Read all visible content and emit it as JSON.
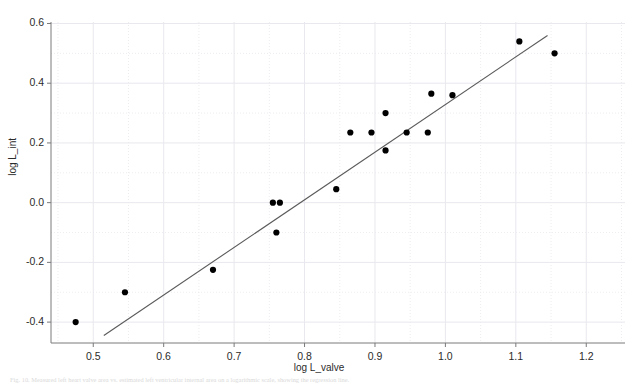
{
  "figure": {
    "background_color": "#ffffff",
    "frame_color": "#7a7a7a",
    "grid_color": "#e8e8ee",
    "point_color": "#000000",
    "line_color": "#5a5a5a",
    "caption": "Fig. 10.  Measured left heart valve area vs. estimated left ventricular internal area on a logarithmic scale, showing the regression line."
  },
  "chart_data": {
    "type": "scatter",
    "title": "",
    "xlabel": "log L_valve",
    "ylabel": "log L_int",
    "xlim": [
      0.44,
      1.255
    ],
    "ylim": [
      -0.47,
      0.605
    ],
    "grid": true,
    "legend": null,
    "xticks": [
      "0.5",
      "0.6",
      "0.7",
      "0.8",
      "0.9",
      "1.0",
      "1.1",
      "1.2"
    ],
    "xtick_values": [
      0.5,
      0.6,
      0.7,
      0.8,
      0.9,
      1.0,
      1.1,
      1.2
    ],
    "yticks": [
      "0.6",
      "0.4",
      "0.2",
      "0.0",
      "-0.2",
      "-0.4"
    ],
    "ytick_values": [
      0.6,
      0.4,
      0.2,
      0.0,
      -0.2,
      -0.4
    ],
    "minor_grid_x": [
      0.45,
      0.55,
      0.65,
      0.75,
      0.85,
      0.95,
      1.05,
      1.15,
      1.25
    ],
    "minor_grid_y": [
      0.5,
      0.3,
      0.1,
      -0.1,
      -0.3
    ],
    "points": [
      {
        "x": 0.475,
        "y": -0.4
      },
      {
        "x": 0.545,
        "y": -0.3
      },
      {
        "x": 0.67,
        "y": -0.225
      },
      {
        "x": 0.755,
        "y": 0.0
      },
      {
        "x": 0.765,
        "y": 0.0
      },
      {
        "x": 0.76,
        "y": -0.1
      },
      {
        "x": 0.845,
        "y": 0.045
      },
      {
        "x": 0.865,
        "y": 0.235
      },
      {
        "x": 0.895,
        "y": 0.235
      },
      {
        "x": 0.915,
        "y": 0.3
      },
      {
        "x": 0.915,
        "y": 0.175
      },
      {
        "x": 0.945,
        "y": 0.235
      },
      {
        "x": 0.975,
        "y": 0.235
      },
      {
        "x": 0.98,
        "y": 0.365
      },
      {
        "x": 1.01,
        "y": 0.36
      },
      {
        "x": 1.105,
        "y": 0.54
      },
      {
        "x": 1.155,
        "y": 0.5
      }
    ],
    "fit_line": {
      "x0": 0.515,
      "y0": -0.445,
      "x1": 1.145,
      "y1": 0.56
    }
  }
}
